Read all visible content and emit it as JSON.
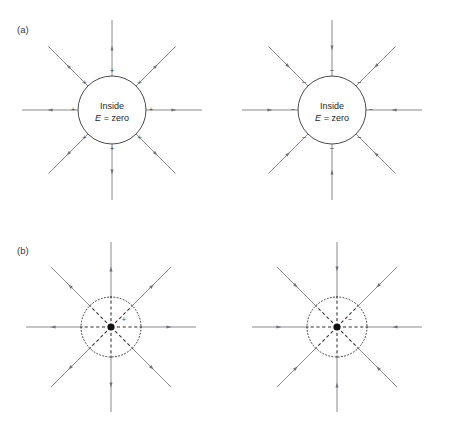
{
  "figure": {
    "width": 450,
    "height": 443,
    "background": "#ffffff",
    "panels": [
      {
        "id": "panel-a",
        "label": "(a)",
        "label_x": 17,
        "label_y": 33,
        "diagrams": [
          {
            "id": "panel-a-left",
            "kind": "charged-conducting-shell",
            "center_x": 112,
            "center_y": 110,
            "shell_radius": 34,
            "charge_sign": "+",
            "field_direction": "outward",
            "num_field_lines": 8,
            "line_outer_radius": 90,
            "arrow_radius": 62,
            "sign_radius": 39,
            "inside_label_line1": "Inside",
            "inside_label_line2_var": "E",
            "inside_label_line2_rest": " = zero"
          },
          {
            "id": "panel-a-right",
            "kind": "charged-conducting-shell",
            "center_x": 332,
            "center_y": 110,
            "shell_radius": 34,
            "charge_sign": "−",
            "field_direction": "inward",
            "num_field_lines": 8,
            "line_outer_radius": 90,
            "arrow_radius": 62,
            "sign_radius": 39,
            "inside_label_line1": "Inside",
            "inside_label_line2_var": "E",
            "inside_label_line2_rest": " = zero"
          }
        ]
      },
      {
        "id": "panel-b",
        "label": "(b)",
        "label_x": 17,
        "label_y": 254,
        "diagrams": [
          {
            "id": "panel-b-left",
            "kind": "point-charge",
            "center_x": 111,
            "center_y": 327,
            "gauss_radius": 30,
            "charge_sign": "+",
            "sign_x": 124,
            "sign_y": 320,
            "field_direction": "outward",
            "num_field_lines": 8,
            "line_outer_radius": 85,
            "arrow_radius": 58,
            "dot_radius": 3.6
          },
          {
            "id": "panel-b-right",
            "kind": "point-charge",
            "center_x": 337,
            "center_y": 327,
            "gauss_radius": 30,
            "charge_sign": "−",
            "sign_x": 350,
            "sign_y": 320,
            "field_direction": "inward",
            "num_field_lines": 8,
            "line_outer_radius": 85,
            "arrow_radius": 58,
            "dot_radius": 3.6
          }
        ]
      }
    ],
    "colors": {
      "field_line": "#7d7d83",
      "arrow": "#6f6f76",
      "shell_stroke": "#4a4a4a",
      "dotted_circle": "#3a3a3a",
      "dashed_radial": "#2e2e2e",
      "center_dot": "#111111",
      "text": "#1f1f1f",
      "panel_label": "#3a3a3a"
    }
  }
}
